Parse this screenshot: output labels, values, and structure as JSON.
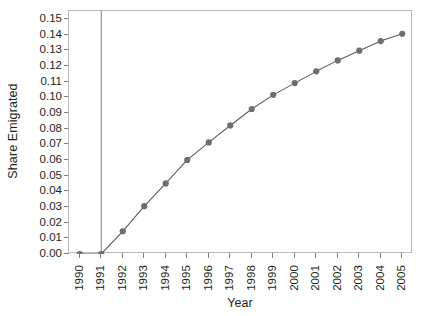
{
  "chart_data": {
    "type": "line",
    "title": "",
    "xlabel": "Year",
    "ylabel": "Share Emigrated",
    "x": [
      1990,
      1991,
      1992,
      1993,
      1994,
      1995,
      1996,
      1997,
      1998,
      1999,
      2000,
      2001,
      2002,
      2003,
      2004,
      2005
    ],
    "values": [
      0.0,
      0.0,
      0.0145,
      0.0305,
      0.045,
      0.06,
      0.0712,
      0.082,
      0.0925,
      0.1015,
      0.109,
      0.1165,
      0.1235,
      0.1297,
      0.1358,
      0.1405
    ],
    "series": [
      {
        "name": "Share Emigrated",
        "values": [
          0.0,
          0.0,
          0.0145,
          0.0305,
          0.045,
          0.06,
          0.0712,
          0.082,
          0.0925,
          0.1015,
          0.109,
          0.1165,
          0.1235,
          0.1297,
          0.1358,
          0.1405
        ]
      }
    ],
    "xlim": [
      1989.5,
      2005.5
    ],
    "ylim": [
      0.0,
      0.155
    ],
    "ytick_values": [
      0.0,
      0.01,
      0.02,
      0.03,
      0.04,
      0.05,
      0.06,
      0.07,
      0.08,
      0.09,
      0.1,
      0.11,
      0.12,
      0.13,
      0.14,
      0.15
    ],
    "ytick_labels": [
      "0.00",
      "0.01",
      "0.02",
      "0.03",
      "0.04",
      "0.05",
      "0.06",
      "0.07",
      "0.08",
      "0.09",
      "0.10",
      "0.11",
      "0.12",
      "0.13",
      "0.14",
      "0.15"
    ],
    "xtick_labels": [
      "1990",
      "1991",
      "1992",
      "1993",
      "1994",
      "1995",
      "1996",
      "1997",
      "1998",
      "1999",
      "2000",
      "2001",
      "2002",
      "2003",
      "2004",
      "2005"
    ],
    "grid": false,
    "legend": "none",
    "marker": "filled-circle",
    "reference_lines": [
      {
        "orientation": "vertical",
        "x": 1991,
        "color": "#7f7f83"
      }
    ],
    "colors": {
      "line": "#5d5d61",
      "marker": "#6e6e72",
      "frame": "#b9b9bb",
      "text": "#231f20",
      "reference_line": "#7f7f83"
    }
  },
  "caption": {
    "text": ""
  }
}
